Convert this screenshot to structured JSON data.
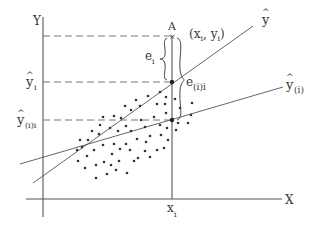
{
  "diagram": {
    "axes": {
      "x_label": "X",
      "y_label": "Y",
      "x_tick_label": "x",
      "x_tick_sub": "i"
    },
    "point_labels": {
      "A": "A",
      "xy_open": "(x",
      "xy_sub1": "i",
      "xy_mid": ", y",
      "xy_sub2": "i",
      "xy_close": ")"
    },
    "y_levels": {
      "yhat_i": "y",
      "yhat_i_sub": "i",
      "yhat_ii": "y",
      "yhat_ii_sub": "(i)i"
    },
    "lines": {
      "yhat": "y",
      "yhat_i_line": "y",
      "yhat_i_line_sub": "(i)"
    },
    "residuals": {
      "e_i": "e",
      "e_i_sub": "i",
      "e_ii": "e",
      "e_ii_sub": "(i)i"
    },
    "hat_glyph": "^",
    "colors": {
      "ink": "#3a3a3a",
      "background": "#ffffff"
    }
  }
}
